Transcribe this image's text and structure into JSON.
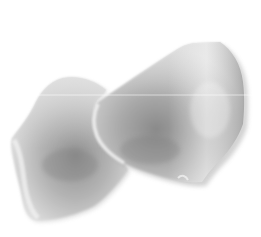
{
  "image": {
    "description": "Two pale grey-white rose petals overlapping on a white background",
    "background": "#ffffff",
    "width": 261,
    "height": 237
  },
  "objects": [
    {
      "name": "left-petal",
      "label": "Left rose petal",
      "colors": {
        "light": "#e6e6e6",
        "mid": "#bdbdbd",
        "dark": "#8f8f8f",
        "edge": "#f4f4f4"
      }
    },
    {
      "name": "right-petal",
      "label": "Right rose petal",
      "colors": {
        "light": "#ebebeb",
        "mid": "#b8b8b8",
        "dark": "#888888",
        "edge": "#f2f2f2"
      }
    }
  ],
  "artifacts": {
    "scanline": {
      "y": 95,
      "color": "#ffffff",
      "opacity": 0.55
    }
  }
}
